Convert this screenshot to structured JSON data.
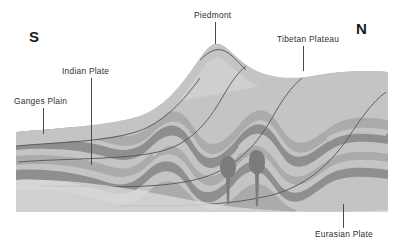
{
  "diagram": {
    "compass": {
      "south_label": "S",
      "north_label": "N"
    },
    "labels": [
      {
        "id": "ganges-plain",
        "text": "Ganges Plain"
      },
      {
        "id": "indian-plate",
        "text": "Indian Plate"
      },
      {
        "id": "piedmont",
        "text": "Piedmont"
      },
      {
        "id": "tibetan-plateau",
        "text": "Tibetan Plateau"
      },
      {
        "id": "eurasian-plate",
        "text": "Eurasian Plate"
      }
    ],
    "colors": {
      "background": "#ffffff",
      "strata_light": "#c4c4c4",
      "strata_medium": "#ababab",
      "strata_dark": "#8f8f8f",
      "basement": "#cfcfcf",
      "pluton": "#7c7c7c",
      "fault_line": "#555555",
      "label_text": "#303030",
      "compass_text": "#1a1a1a"
    },
    "features": {
      "plutons_count": 2,
      "thrust_faults_count": 4,
      "fold_layers_count": 5
    }
  }
}
